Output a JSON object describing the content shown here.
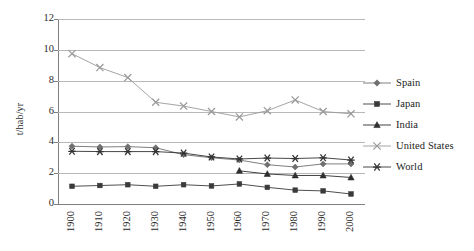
{
  "chart_data": {
    "type": "line",
    "title": "",
    "xlabel": "",
    "ylabel": "t/hab/yr",
    "categories": [
      "1900",
      "1910",
      "1920",
      "1930",
      "1940",
      "1950",
      "1960",
      "1970",
      "1980",
      "1990",
      "2000"
    ],
    "ylim": [
      0,
      12
    ],
    "yticks": [
      0,
      2,
      4,
      6,
      8,
      10,
      12
    ],
    "grid": "horizontal",
    "legend_position": "right",
    "series": [
      {
        "name": "Spain",
        "marker": "diamond",
        "color": "#6f6f6f",
        "values": [
          3.75,
          3.7,
          3.72,
          3.65,
          3.2,
          3.0,
          2.85,
          2.55,
          2.4,
          2.6,
          2.6
        ]
      },
      {
        "name": "Japan",
        "marker": "square",
        "color": "#3a3a3a",
        "values": [
          1.15,
          1.2,
          1.25,
          1.15,
          1.25,
          1.17,
          1.3,
          1.08,
          0.9,
          0.85,
          0.65
        ]
      },
      {
        "name": "India",
        "marker": "triangle",
        "color": "#2e2e2e",
        "values": [
          null,
          null,
          null,
          null,
          null,
          null,
          2.15,
          1.95,
          1.85,
          1.85,
          1.72
        ]
      },
      {
        "name": "United States",
        "marker": "cross",
        "color": "#9a9a9a",
        "values": [
          9.75,
          8.85,
          8.2,
          6.6,
          6.35,
          6.0,
          5.65,
          6.05,
          6.75,
          6.0,
          5.85
        ]
      },
      {
        "name": "World",
        "marker": "asterisk",
        "color": "#333333",
        "values": [
          3.42,
          3.4,
          3.4,
          3.4,
          3.3,
          3.05,
          2.92,
          2.98,
          2.95,
          3.0,
          2.85
        ]
      }
    ]
  },
  "axes": {
    "y_title": "t/hab/yr",
    "y_tick_labels": [
      "12",
      "10",
      "8",
      "6",
      "4",
      "2",
      "0"
    ],
    "x_tick_labels": [
      "1900",
      "1910",
      "1920",
      "1930",
      "1940",
      "1950",
      "1960",
      "1970",
      "1980",
      "1990",
      "2000"
    ]
  },
  "legend": {
    "entries": [
      {
        "label": "Spain",
        "marker": "diamond",
        "color": "#6f6f6f"
      },
      {
        "label": "Japan",
        "marker": "square",
        "color": "#3a3a3a"
      },
      {
        "label": "India",
        "marker": "triangle",
        "color": "#2e2e2e"
      },
      {
        "label": "United States",
        "marker": "cross",
        "color": "#9a9a9a"
      },
      {
        "label": "World",
        "marker": "asterisk",
        "color": "#333333"
      }
    ]
  },
  "colors": {
    "gridline": "#b8b8b8",
    "axis": "#7f7f7f",
    "background": "#ffffff",
    "text": "#2b2b2b"
  }
}
